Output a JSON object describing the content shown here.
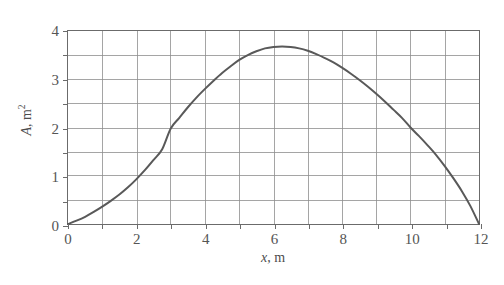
{
  "chart_data": {
    "type": "line",
    "title": "",
    "subtitle": "",
    "xlabel": "x, m",
    "ylabel": "A, m²",
    "xlabel_symbol": "x",
    "xlabel_unit": ", m",
    "ylabel_symbol": "A",
    "ylabel_unit": ", m",
    "ylabel_exponent": "2",
    "xlim": [
      0,
      12
    ],
    "ylim": [
      0,
      4
    ],
    "xticks": [
      0,
      2,
      4,
      6,
      8,
      10,
      12
    ],
    "xtick_labels": [
      "0",
      "2",
      "4",
      "6",
      "8",
      "10",
      "12"
    ],
    "yticks": [
      0,
      1,
      2,
      3,
      4
    ],
    "ytick_labels": [
      "0",
      "1",
      "2",
      "3",
      "4"
    ],
    "x_gridline_step": 1,
    "y_gridline_step": 0.5,
    "x_minor_tick_step": 1,
    "y_minor_tick_step": 0.5,
    "grid": true,
    "legend": false,
    "legend_position": "none",
    "curve_color": "#595959",
    "grid_color": "#8d8d8d",
    "frame_color": "#6b6b6b",
    "background_color": "#ffffff",
    "series": [
      {
        "name": "A(x)",
        "x": [
          0,
          0.25,
          0.5,
          0.75,
          1,
          1.25,
          1.5,
          1.75,
          2,
          2.25,
          2.5,
          2.75,
          3,
          3.25,
          3.5,
          3.75,
          4,
          4.25,
          4.5,
          4.75,
          5,
          5.25,
          5.5,
          5.75,
          6,
          6.25,
          6.5,
          6.75,
          7,
          7.25,
          7.5,
          7.75,
          8,
          8.25,
          8.5,
          8.75,
          9,
          9.25,
          9.5,
          9.75,
          10,
          10.25,
          10.5,
          10.75,
          11,
          11.25,
          11.5,
          11.75,
          12
        ],
        "y": [
          0.0,
          0.07,
          0.15,
          0.25,
          0.36,
          0.48,
          0.61,
          0.76,
          0.93,
          1.12,
          1.33,
          1.55,
          1.98,
          2.2,
          2.42,
          2.62,
          2.8,
          2.97,
          3.13,
          3.27,
          3.4,
          3.5,
          3.58,
          3.64,
          3.67,
          3.68,
          3.67,
          3.64,
          3.59,
          3.52,
          3.44,
          3.35,
          3.24,
          3.12,
          2.99,
          2.85,
          2.7,
          2.54,
          2.37,
          2.2,
          2.0,
          1.82,
          1.63,
          1.43,
          1.2,
          0.95,
          0.68,
          0.37,
          0.0
        ]
      }
    ],
    "annotations": [],
    "notable_points": {
      "start": {
        "x": 0,
        "y": 0
      },
      "peak": {
        "x": 6.3,
        "y": 3.68
      },
      "end": {
        "x": 12,
        "y": 0
      }
    }
  },
  "figure": {
    "caption": ""
  }
}
